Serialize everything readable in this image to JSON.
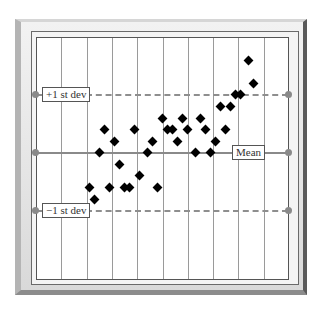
{
  "chart_data": {
    "type": "scatter",
    "title": "",
    "xlabel": "",
    "ylabel": "",
    "grid": {
      "vertical": true,
      "horizontal": false,
      "columns": 10
    },
    "reference_lines": [
      {
        "name": "+1 st dev",
        "value": 1,
        "style": "dashed",
        "label_position": "left"
      },
      {
        "name": "Mean",
        "value": 0,
        "style": "solid",
        "label_position": "right"
      },
      {
        "name": "-1 st dev",
        "value": -1,
        "style": "dashed",
        "label_position": "left"
      }
    ],
    "ylim": [
      -2.2,
      2.0
    ],
    "xlim": [
      0,
      10
    ],
    "marker": "diamond",
    "points": [
      {
        "x": 2.1,
        "y": -0.6
      },
      {
        "x": 2.3,
        "y": -0.8
      },
      {
        "x": 2.5,
        "y": 0.0
      },
      {
        "x": 2.7,
        "y": 0.4
      },
      {
        "x": 2.9,
        "y": -0.6
      },
      {
        "x": 3.1,
        "y": 0.2
      },
      {
        "x": 3.3,
        "y": -0.2
      },
      {
        "x": 3.5,
        "y": -0.6
      },
      {
        "x": 3.7,
        "y": -0.6
      },
      {
        "x": 3.9,
        "y": 0.4
      },
      {
        "x": 4.1,
        "y": -0.4
      },
      {
        "x": 4.4,
        "y": 0.0
      },
      {
        "x": 4.6,
        "y": 0.2
      },
      {
        "x": 4.8,
        "y": -0.6
      },
      {
        "x": 5.0,
        "y": 0.6
      },
      {
        "x": 5.2,
        "y": 0.4
      },
      {
        "x": 5.4,
        "y": 0.4
      },
      {
        "x": 5.6,
        "y": 0.2
      },
      {
        "x": 5.8,
        "y": 0.6
      },
      {
        "x": 6.0,
        "y": 0.4
      },
      {
        "x": 6.3,
        "y": 0.0
      },
      {
        "x": 6.5,
        "y": 0.6
      },
      {
        "x": 6.7,
        "y": 0.4
      },
      {
        "x": 6.9,
        "y": 0.0
      },
      {
        "x": 7.1,
        "y": 0.2
      },
      {
        "x": 7.3,
        "y": 0.8
      },
      {
        "x": 7.5,
        "y": 0.4
      },
      {
        "x": 7.7,
        "y": 0.8
      },
      {
        "x": 7.9,
        "y": 1.0
      },
      {
        "x": 8.1,
        "y": 1.0
      },
      {
        "x": 8.4,
        "y": 1.6
      },
      {
        "x": 8.6,
        "y": 1.2
      }
    ]
  },
  "labels": {
    "plus_sd": "+1 st dev",
    "mean": "Mean",
    "minus_sd": "−1 st dev"
  },
  "colors": {
    "points": "#000000",
    "reference_lines": "#8a8a8a",
    "grid": "#9a9a9a"
  }
}
